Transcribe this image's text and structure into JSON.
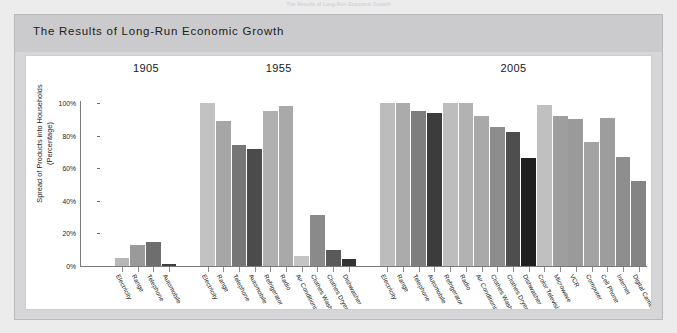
{
  "running_head": "The Results of Long-Run Economic Growth",
  "card": {
    "title": "The Results of Long-Run Economic Growth"
  },
  "chart_data": {
    "type": "bar",
    "title": "The Results of Long-Run Economic Growth",
    "xlabel": "",
    "ylabel": "Spread of Products into Households (Percentage)",
    "ylim": [
      0,
      100
    ],
    "ytick_labels": [
      "0%",
      "20%",
      "40%",
      "60%",
      "80%",
      "100%"
    ],
    "ytick_values": [
      0,
      20,
      40,
      60,
      80,
      100
    ],
    "grid": false,
    "legend": "none",
    "value_unit": "%",
    "groups": [
      {
        "name": "1905",
        "categories": [
          "Electricity",
          "Range",
          "Telephone",
          "Automobile"
        ],
        "values": [
          5,
          13,
          15,
          1
        ],
        "shades": [
          "#b7b7b7",
          "#9a9a9a",
          "#6e6e6e",
          "#3f3f3f"
        ]
      },
      {
        "name": "1955",
        "categories": [
          "Electricity",
          "Range",
          "Telephone",
          "Automobile",
          "Refrigerator",
          "Radio",
          "Air Conditioning",
          "Clothes Washer",
          "Clothes Dryer",
          "Dishwasher"
        ],
        "values": [
          100,
          89,
          74,
          72,
          95,
          98,
          6,
          31,
          10,
          4
        ],
        "shades": [
          "#c2c2c2",
          "#a6a6a6",
          "#767676",
          "#4b4b4b",
          "#b0b0b0",
          "#a9a9a9",
          "#c4c4c4",
          "#8a8a8a",
          "#5a5a5a",
          "#333333"
        ]
      },
      {
        "name": "2005",
        "categories": [
          "Electricity",
          "Range",
          "Telephone",
          "Automobile",
          "Refrigerator",
          "Radio",
          "Air Conditioning",
          "Clothes Washer",
          "Clothes Dryer",
          "Dishwasher",
          "Color Television",
          "Microwave",
          "VCR",
          "Computer",
          "Cell Phone",
          "Internet",
          "Digital Camera"
        ],
        "values": [
          100,
          100,
          95,
          94,
          100,
          100,
          92,
          85,
          82,
          66,
          99,
          92,
          90,
          76,
          91,
          67,
          52
        ],
        "shades": [
          "#bcbcbc",
          "#ababab",
          "#7e7e7e",
          "#3c3c3c",
          "#bdbdbd",
          "#b2b2b2",
          "#a9a9a9",
          "#8d8d8d",
          "#4e4e4e",
          "#1f1f1f",
          "#c0c0c0",
          "#9e9e9e",
          "#9a9a9a",
          "#a3a3a3",
          "#9d9d9d",
          "#8e8e8e",
          "#848484"
        ]
      }
    ]
  }
}
